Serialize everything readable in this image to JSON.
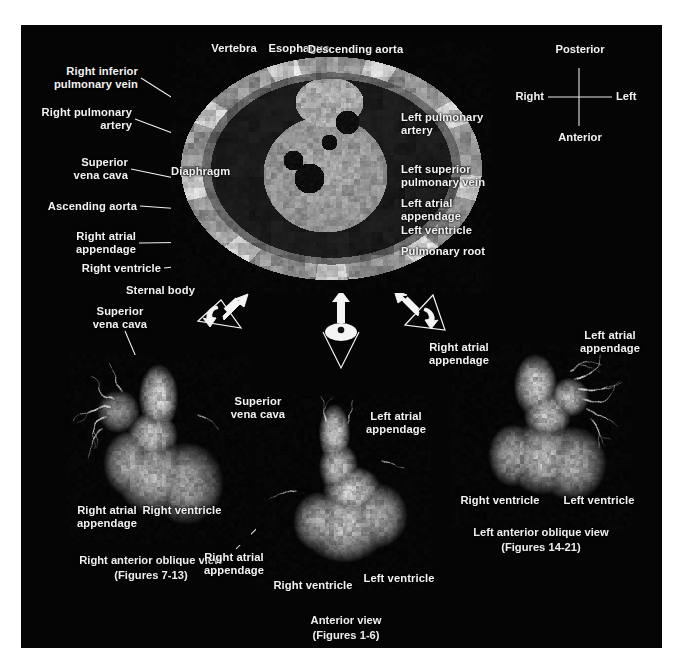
{
  "figure": {
    "background_color": "#050505",
    "text_color": "#f2f2f2",
    "panel_border_color": "#000000"
  },
  "compass": {
    "name": "orientation-compass",
    "posterior": "Posterior",
    "anterior": "Anterior",
    "right": "Right",
    "left": "Left"
  },
  "cross_section": {
    "name": "axial-mri-cross-section",
    "labels_left": [
      {
        "id": "right-inferior-pulmonary-vein",
        "text": "Right inferior\npulmonary vein"
      },
      {
        "id": "right-pulmonary-artery",
        "text": "Right pulmonary\nartery"
      },
      {
        "id": "superior-vena-cava",
        "text": "Superior\nvena cava"
      },
      {
        "id": "ascending-aorta",
        "text": "Ascending aorta"
      },
      {
        "id": "right-atrial-appendage",
        "text": "Right atrial\nappendage"
      },
      {
        "id": "right-ventricle",
        "text": "Right ventricle"
      },
      {
        "id": "sternal-body",
        "text": "Sternal body"
      }
    ],
    "labels_top": [
      {
        "id": "vertebra",
        "text": "Vertebra"
      },
      {
        "id": "esophagus",
        "text": "Esophagus"
      },
      {
        "id": "descending-aorta",
        "text": "Descending aorta"
      }
    ],
    "labels_inner": [
      {
        "id": "diaphragm",
        "text": "Diaphragm"
      }
    ],
    "labels_right": [
      {
        "id": "left-pulmonary-artery",
        "text": "Left pulmonary\nartery"
      },
      {
        "id": "left-superior-pulmonary-vein",
        "text": "Left superior\npulmonary vein"
      },
      {
        "id": "left-atrial-appendage",
        "text": "Left atrial\nappendage"
      },
      {
        "id": "left-ventricle",
        "text": "Left ventricle"
      },
      {
        "id": "pulmonary-root",
        "text": "Pulmonary root"
      }
    ]
  },
  "view_indicators": [
    {
      "id": "view-indicator-right-anterior-oblique",
      "kind": "eye-cone-arrow"
    },
    {
      "id": "view-indicator-anterior",
      "kind": "eye-cone-arrow"
    },
    {
      "id": "view-indicator-left-anterior-oblique",
      "kind": "eye-cone-arrow"
    }
  ],
  "views": [
    {
      "id": "right-anterior-oblique-view",
      "caption": "Right anterior oblique view",
      "figures": "(Figures 7-13)",
      "labels": [
        {
          "id": "superior-vena-cava",
          "text": "Superior\nvena cava"
        },
        {
          "id": "right-atrial-appendage",
          "text": "Right atrial\nappendage"
        },
        {
          "id": "right-ventricle",
          "text": "Right ventricle"
        }
      ]
    },
    {
      "id": "anterior-view",
      "caption": "Anterior view",
      "figures": "(Figures 1-6)",
      "labels": [
        {
          "id": "superior-vena-cava",
          "text": "Superior\nvena cava"
        },
        {
          "id": "left-atrial-appendage",
          "text": "Left atrial\nappendage"
        },
        {
          "id": "right-atrial-appendage",
          "text": "Right atrial\nappendage"
        },
        {
          "id": "right-ventricle",
          "text": "Right ventricle"
        },
        {
          "id": "left-ventricle",
          "text": "Left ventricle"
        }
      ]
    },
    {
      "id": "left-anterior-oblique-view",
      "caption": "Left anterior oblique view",
      "figures": "(Figures 14-21)",
      "labels": [
        {
          "id": "right-atrial-appendage",
          "text": "Right atrial\nappendage"
        },
        {
          "id": "left-atrial-appendage",
          "text": "Left atrial\nappendage"
        },
        {
          "id": "right-ventricle",
          "text": "Right ventricle"
        },
        {
          "id": "left-ventricle",
          "text": "Left ventricle"
        }
      ]
    }
  ]
}
